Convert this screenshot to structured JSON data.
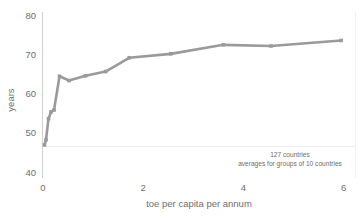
{
  "chart_data": {
    "type": "line",
    "title": "",
    "subtitle": "",
    "xlabel": "toe per capita per annum",
    "ylabel": "years",
    "xlim": [
      -0.12,
      6.1
    ],
    "ylim": [
      40,
      80
    ],
    "xticks": [
      0,
      2,
      4,
      6
    ],
    "xtick_labels": [
      "0",
      "2",
      "4",
      "6"
    ],
    "yticks": [
      40,
      50,
      60,
      70,
      80
    ],
    "ytick_labels": [
      "40",
      "50",
      "60",
      "70",
      "80"
    ],
    "grid": false,
    "legend": "none",
    "series": [
      {
        "name": "life expectancy vs energy use",
        "color": "#9a9a9c",
        "marker": "square",
        "x": [
          0.03,
          0.06,
          0.11,
          0.16,
          0.22,
          0.33,
          0.52,
          0.85,
          1.25,
          1.72,
          2.55,
          3.6,
          4.55,
          5.95
        ],
        "y": [
          46.9,
          48.2,
          53.6,
          55.3,
          55.8,
          64.4,
          63.3,
          64.5,
          65.6,
          69.1,
          70.1,
          72.4,
          72.1,
          73.5
        ]
      }
    ],
    "annotations": [
      {
        "id": "annot-count",
        "text": "127 countries"
      },
      {
        "id": "annot-method",
        "text": "averages for groups of 10 countries"
      }
    ]
  },
  "axes": {
    "y_axis_title": "years",
    "x_axis_title": "toe per capita per annum"
  },
  "colors": {
    "line": "#9a9a9c",
    "axis": "#c9c9cb",
    "text": "#6d6e70",
    "background": "#ffffff"
  }
}
